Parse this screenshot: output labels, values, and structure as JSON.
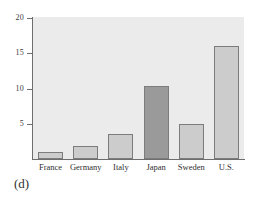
{
  "figure": {
    "caption": "(d)",
    "background_color": "#ffffff",
    "plot_background_color": "#ebebeb",
    "axis_color": "#6e6e6e",
    "bar_fill_color": "#cccccc",
    "bar_highlight_color": "#9a9a9a",
    "bar_edge_color": "#7c7c7c"
  },
  "chart_data": {
    "type": "bar",
    "title": "",
    "xlabel": "",
    "ylabel": "",
    "categories": [
      "France",
      "Germany",
      "Italy",
      "Japan",
      "Sweden",
      "U.S."
    ],
    "values": [
      1.0,
      1.8,
      3.6,
      10.3,
      4.9,
      16.0
    ],
    "highlighted_category": "Japan",
    "ylim": [
      0,
      20
    ],
    "yticks": [
      5,
      10,
      15,
      20
    ],
    "ytick_labels": [
      "5",
      "10",
      "15",
      "20"
    ],
    "grid": false,
    "legend": "none",
    "bar_colors": [
      "#cccccc",
      "#cccccc",
      "#cccccc",
      "#9a9a9a",
      "#cccccc",
      "#cccccc"
    ]
  }
}
